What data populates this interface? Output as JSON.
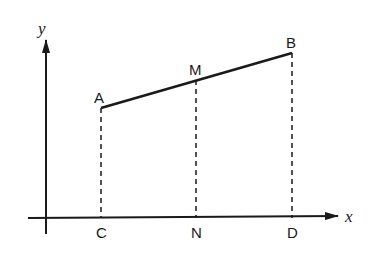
{
  "diagram": {
    "type": "coordinate-geometry",
    "axes": {
      "x_label": "x",
      "y_label": "y"
    },
    "points": {
      "A": {
        "label": "A",
        "px": [
          101,
          108
        ]
      },
      "M": {
        "label": "M",
        "px": [
          196,
          80
        ]
      },
      "B": {
        "label": "B",
        "px": [
          292,
          53
        ]
      },
      "C": {
        "label": "C",
        "px": [
          101,
          218
        ]
      },
      "N": {
        "label": "N",
        "px": [
          196,
          218
        ]
      },
      "D": {
        "label": "D",
        "px": [
          292,
          218
        ]
      }
    },
    "segments": [
      {
        "from": "A",
        "to": "B",
        "style": "solid"
      },
      {
        "from": "A",
        "to": "C",
        "style": "dashed"
      },
      {
        "from": "M",
        "to": "N",
        "style": "dashed"
      },
      {
        "from": "B",
        "to": "D",
        "style": "dashed"
      }
    ],
    "colors": {
      "ink": "#1a1a1a",
      "background": "#ffffff"
    }
  }
}
